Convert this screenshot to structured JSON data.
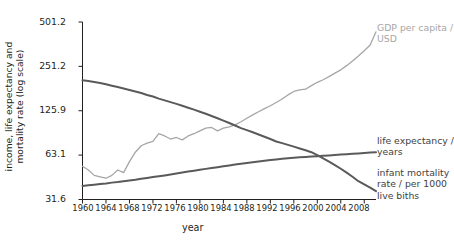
{
  "chart_data": {
    "type": "line",
    "title": "",
    "xlabel": "year",
    "ylabel": "income, life expectancy and mortality rate (log scale)",
    "ylabel_line1": "income, life expectancy and",
    "ylabel_line2": "mortality rate (log scale)",
    "log_scale": true,
    "grid": false,
    "legend_position": "right-inline",
    "xlim": [
      1960,
      2010
    ],
    "ylim": [
      31.6,
      501.2
    ],
    "ytick_labels": [
      "501.2",
      "251.2",
      "125.9",
      "63.1",
      "31.6"
    ],
    "ytick_values": [
      501.2,
      251.2,
      125.9,
      63.1,
      31.6
    ],
    "xtick_labels": [
      "1960",
      "1964",
      "1968",
      "1972",
      "1976",
      "1980",
      "1984",
      "1988",
      "1992",
      "1996",
      "2000",
      "2004",
      "2008"
    ],
    "xtick_values": [
      1960,
      1964,
      1968,
      1972,
      1976,
      1980,
      1984,
      1988,
      1992,
      1996,
      2000,
      2004,
      2008
    ],
    "x": [
      1960,
      1961,
      1962,
      1963,
      1964,
      1965,
      1966,
      1967,
      1968,
      1969,
      1970,
      1971,
      1972,
      1973,
      1974,
      1975,
      1976,
      1977,
      1978,
      1979,
      1980,
      1981,
      1982,
      1983,
      1984,
      1985,
      1986,
      1987,
      1988,
      1989,
      1990,
      1991,
      1992,
      1993,
      1994,
      1995,
      1996,
      1997,
      1998,
      1999,
      2000,
      2001,
      2002,
      2003,
      2004,
      2005,
      2006,
      2007,
      2008,
      2009,
      2010
    ],
    "series": [
      {
        "name": "GDP per capita / USD",
        "label_line1": "GDP per capita /",
        "label_line2": "USD",
        "color": "#a6a6a6",
        "width": 1.3,
        "values": [
          53,
          50,
          46,
          45,
          44,
          46,
          50,
          48,
          57,
          66,
          73,
          76,
          78,
          88,
          85,
          81,
          83,
          80,
          85,
          88,
          92,
          96,
          97,
          92,
          96,
          98,
          101,
          106,
          112,
          118,
          124,
          130,
          136,
          143,
          151,
          161,
          170,
          174,
          176,
          186,
          196,
          204,
          214,
          226,
          238,
          254,
          273,
          295,
          320,
          350,
          430
        ]
      },
      {
        "name": "life expectancy / years",
        "label_line1": "life expectancy /",
        "label_line2": "years",
        "color": "#5a5a5a",
        "width": 2.0,
        "values": [
          39.0,
          39.4,
          39.8,
          40.2,
          40.6,
          41.1,
          41.5,
          42.0,
          42.5,
          43.0,
          43.6,
          44.2,
          44.8,
          45.4,
          46.0,
          46.7,
          47.4,
          48.1,
          48.8,
          49.5,
          50.2,
          50.9,
          51.6,
          52.3,
          53.0,
          53.7,
          54.4,
          55.1,
          55.8,
          56.5,
          57.2,
          57.8,
          58.4,
          59.0,
          59.6,
          60.1,
          60.6,
          61.0,
          61.3,
          61.7,
          62.0,
          62.4,
          62.8,
          63.2,
          63.6,
          64.0,
          64.4,
          64.8,
          65.2,
          65.6,
          66.0
        ]
      },
      {
        "name": "infant mortality rate / per 1000 live biths",
        "label_line1": "infant mortality",
        "label_line2": "rate / per 1000",
        "label_line3": "live biths",
        "color": "#5a5a5a",
        "width": 2.0,
        "values": [
          202,
          200,
          197,
          194,
          190,
          186,
          182,
          178,
          174,
          170,
          166,
          161,
          157,
          152,
          148,
          144,
          140,
          136,
          132,
          128,
          124,
          120,
          116,
          112,
          108,
          104,
          100,
          96,
          93,
          90,
          87,
          84,
          81,
          78,
          76,
          74,
          72,
          70,
          68,
          66,
          63,
          60,
          57,
          54,
          51,
          48,
          45,
          42,
          40,
          38,
          36
        ]
      }
    ]
  }
}
